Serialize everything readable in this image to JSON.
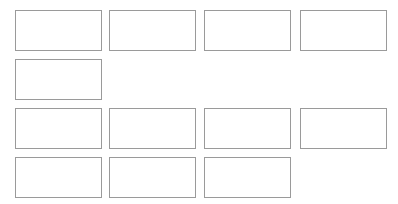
{
  "layout": {
    "box_width": 87,
    "box_height": 41,
    "border_color": "#9a9a9a",
    "background": "#ffffff"
  },
  "rows": [
    {
      "y": 10,
      "boxes": [
        {
          "x": 15
        },
        {
          "x": 109
        },
        {
          "x": 204
        },
        {
          "x": 300
        }
      ]
    },
    {
      "y": 59,
      "boxes": [
        {
          "x": 15
        }
      ]
    },
    {
      "y": 108,
      "boxes": [
        {
          "x": 15
        },
        {
          "x": 109
        },
        {
          "x": 204
        },
        {
          "x": 300
        }
      ]
    },
    {
      "y": 157,
      "boxes": [
        {
          "x": 15
        },
        {
          "x": 109
        },
        {
          "x": 204
        }
      ]
    }
  ]
}
